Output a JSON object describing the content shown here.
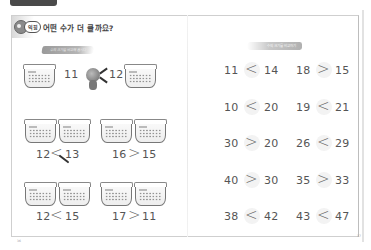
{
  "header": {
    "tab_label": "",
    "step_badge": "익힘",
    "title": "어떤 수가 더 클까요?",
    "left_bubble": "수의 크기를 비교해 봅시다",
    "right_bubble": "수의 크기를 비교하기"
  },
  "left_page": {
    "example": {
      "left_number": "11",
      "right_number": "12",
      "symbol": "<"
    },
    "problems": [
      {
        "left": "12",
        "symbol": "<",
        "right": "13"
      },
      {
        "left": "16",
        "symbol": ">",
        "right": "15"
      },
      {
        "left": "12",
        "symbol": "<",
        "right": "15"
      },
      {
        "left": "17",
        "symbol": ">",
        "right": "11"
      }
    ],
    "page_number": "36"
  },
  "right_page": {
    "problems": [
      {
        "left": "11",
        "symbol": "<",
        "right": "14"
      },
      {
        "left": "18",
        "symbol": ">",
        "right": "15"
      },
      {
        "left": "10",
        "symbol": "<",
        "right": "20"
      },
      {
        "left": "19",
        "symbol": "<",
        "right": "21"
      },
      {
        "left": "30",
        "symbol": ">",
        "right": "20"
      },
      {
        "left": "26",
        "symbol": "<",
        "right": "29"
      },
      {
        "left": "40",
        "symbol": ">",
        "right": "30"
      },
      {
        "left": "35",
        "symbol": ">",
        "right": "33"
      },
      {
        "left": "38",
        "symbol": "<",
        "right": "42"
      },
      {
        "left": "43",
        "symbol": "<",
        "right": "47"
      }
    ],
    "page_number": "37"
  },
  "colors": {
    "text": "#555555",
    "border": "#cfcfcf",
    "tab": "#4a4a4a",
    "bubble": "#9a9a9a"
  }
}
